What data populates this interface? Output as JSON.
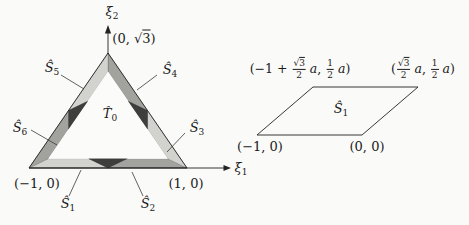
{
  "colors": {
    "background": "#fafaf8",
    "band_light": "#d2d2cf",
    "band_medium": "#a2a29f",
    "overlap_dark": "#3e3e3c",
    "inner_fill": "#fbfbfa",
    "line": "#232321"
  },
  "left_figure": {
    "axes": {
      "xi1": {
        "base": "ξ",
        "sub": "1"
      },
      "xi2": {
        "base": "ξ",
        "sub": "2"
      }
    },
    "vertices": {
      "top_pre": "(0, ",
      "top_rad": "√",
      "top_radicand": "3",
      "top_post": ")",
      "bottom_left": "(−1, 0)",
      "bottom_right": "(1, 0)"
    },
    "regions": {
      "t0": {
        "base": "T̂",
        "sub": "0"
      },
      "s1": {
        "base": "Ŝ",
        "sub": "1"
      },
      "s2": {
        "base": "Ŝ",
        "sub": "2"
      },
      "s3": {
        "base": "Ŝ",
        "sub": "3"
      },
      "s4": {
        "base": "Ŝ",
        "sub": "4"
      },
      "s5": {
        "base": "Ŝ",
        "sub": "5"
      },
      "s6": {
        "base": "Ŝ",
        "sub": "6"
      }
    }
  },
  "right_figure": {
    "region": {
      "base": "Ŝ",
      "sub": "1"
    },
    "corners": {
      "bottom_left": "(−1, 0)",
      "bottom_right": "(0, 0)",
      "top_left": {
        "pre": "(−1 + ",
        "rad": "√",
        "radicand": "3",
        "den": "2",
        "var1": "a",
        "sep": ", ",
        "num2": "1",
        "den2": "2",
        "var2": "a",
        "post": ")"
      },
      "top_right": {
        "pre": "(",
        "rad": "√",
        "radicand": "3",
        "den": "2",
        "var1": "a",
        "sep": ", ",
        "num2": "1",
        "den2": "2",
        "var2": "a",
        "post": ")"
      }
    }
  }
}
